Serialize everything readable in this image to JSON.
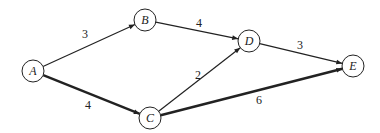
{
  "diagram": {
    "type": "weighted-directed-graph",
    "nodes": [
      {
        "id": "A",
        "label": "A",
        "x": 33,
        "y": 71
      },
      {
        "id": "B",
        "label": "B",
        "x": 145,
        "y": 20
      },
      {
        "id": "C",
        "label": "C",
        "x": 150,
        "y": 118
      },
      {
        "id": "D",
        "label": "D",
        "x": 249,
        "y": 41
      },
      {
        "id": "E",
        "label": "E",
        "x": 353,
        "y": 66
      }
    ],
    "edges": [
      {
        "from": "A",
        "to": "B",
        "weight": "3",
        "bold": false,
        "lx": 85,
        "ly": 38
      },
      {
        "from": "A",
        "to": "C",
        "weight": "4",
        "bold": true,
        "lx": 88,
        "ly": 109
      },
      {
        "from": "B",
        "to": "D",
        "weight": "4",
        "bold": false,
        "lx": 199,
        "ly": 27
      },
      {
        "from": "C",
        "to": "D",
        "weight": "2",
        "bold": false,
        "lx": 198,
        "ly": 79
      },
      {
        "from": "D",
        "to": "E",
        "weight": "3",
        "bold": false,
        "lx": 300,
        "ly": 49
      },
      {
        "from": "C",
        "to": "E",
        "weight": "6",
        "bold": true,
        "lx": 259,
        "ly": 104
      }
    ],
    "colors": {
      "stroke": "#222222",
      "node_fill": "#ffffff"
    }
  }
}
